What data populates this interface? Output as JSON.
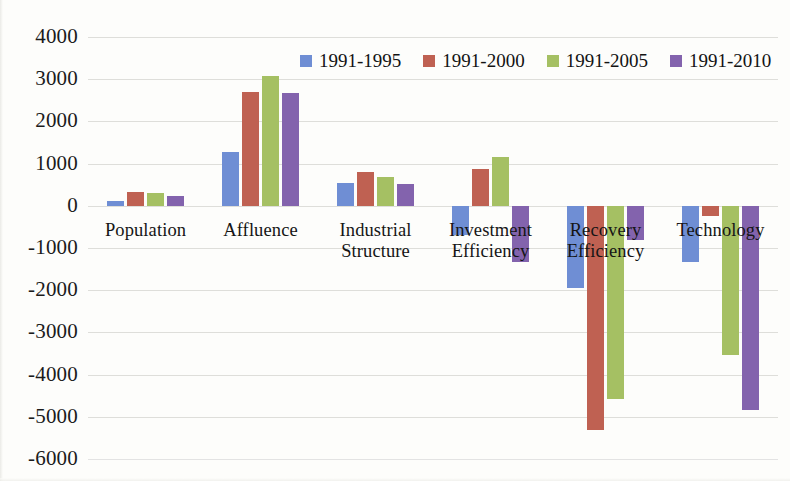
{
  "chart_data": {
    "type": "bar",
    "title": "",
    "xlabel": "",
    "ylabel": "",
    "ylim": [
      -6000,
      4000
    ],
    "ytick_step": 1000,
    "grid": true,
    "legend_position": "top-center",
    "orientation": "vertical",
    "categories": [
      "Population",
      "Affluence",
      "Industrial\nStructure",
      "Investment\nEfficiency",
      "Recovery\nEfficiency",
      "Technology"
    ],
    "ytick_labels": [
      "4000",
      "3000",
      "2000",
      "1000",
      "0",
      "-1000",
      "-2000",
      "-3000",
      "-4000",
      "-5000",
      "-6000"
    ],
    "ytick_values": [
      4000,
      3000,
      2000,
      1000,
      0,
      -1000,
      -2000,
      -3000,
      -4000,
      -5000,
      -6000
    ],
    "series": [
      {
        "name": "1991-1995",
        "color": "#6f8ed4",
        "values": [
          110,
          1270,
          540,
          -690,
          -1940,
          -1330
        ]
      },
      {
        "name": "1991-2000",
        "color": "#bf6152",
        "values": [
          320,
          2700,
          810,
          870,
          -5320,
          -250
        ]
      },
      {
        "name": "1991-2005",
        "color": "#a5c063",
        "values": [
          310,
          3080,
          690,
          1160,
          -4570,
          -3530
        ]
      },
      {
        "name": "1991-2010",
        "color": "#8363ad",
        "values": [
          230,
          2670,
          520,
          -1320,
          -800,
          -4850
        ]
      }
    ]
  },
  "colors": {
    "series_1991_1995": "#6f8ed4",
    "series_1991_2000": "#bf6152",
    "series_1991_2005": "#a5c063",
    "series_1991_2010": "#8363ad",
    "gridline": "#d8d8d4",
    "axis_text": "#1b1b1b",
    "background": "#fdfdfb"
  }
}
